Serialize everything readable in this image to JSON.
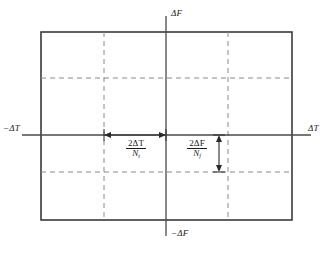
{
  "figure": {
    "type": "engineering-diagram",
    "colors": {
      "rectangle_border": "#3a3a3a",
      "axis_line": "#4a4a4a",
      "dashed_grid": "#8a8a8a",
      "dimension_arrow": "#2a2a2a",
      "text": "#1a1a1a",
      "background": "#ffffff"
    }
  },
  "axes": {
    "vertical_top_label": "ΔF",
    "vertical_bottom_label": "−ΔF",
    "horizontal_left_label": "−ΔT",
    "horizontal_right_label": "ΔT"
  },
  "annotations": {
    "horizontal_cell": {
      "numerator_coefficient": "2",
      "numerator_symbol": "ΔT",
      "denominator_symbol": "N",
      "denominator_subscript": "t",
      "full": "2ΔT / Nₜ"
    },
    "vertical_cell": {
      "numerator_coefficient": "2",
      "numerator_symbol": "ΔF",
      "denominator_symbol": "N",
      "denominator_subscript": "f",
      "full": "2ΔF / Nᶠ"
    }
  },
  "geometry": {
    "rectangle": {
      "x1": 41,
      "y1": 32,
      "x2": 292,
      "y2": 220
    },
    "axis_vertical_x": 166,
    "axis_horizontal_y": 135,
    "dashed_vertical_x": [
      104,
      228
    ],
    "dashed_horizontal_y": [
      78,
      172
    ],
    "dimension_horizontal": {
      "x1": 104,
      "x2": 166,
      "y": 135
    },
    "dimension_vertical": {
      "x": 219,
      "y1": 135,
      "y2": 172
    }
  }
}
